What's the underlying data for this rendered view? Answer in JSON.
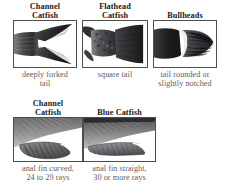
{
  "figure": {
    "background_color": "#ffffff",
    "heading_color": "#18181a",
    "caption_color": "#5d5d5f",
    "panel_border_color": "#4d4d4f"
  },
  "rows": [
    {
      "id": "tail-shape-row",
      "cells": [
        {
          "heading": "Channel\nCatfish",
          "heading_line1": "Channel",
          "heading_line2": "Catfish",
          "caption": "deeply forked tail",
          "caption_line1": "deeply forked",
          "caption_line2": "tail",
          "image_name": "channel-catfish-tail-illustration",
          "image_subject": "deeply forked caudal fin"
        },
        {
          "heading": "Flathead\nCatfish",
          "heading_line1": "Flathead",
          "heading_line2": "Catfish",
          "caption": "square tail",
          "caption_line1": "square tail",
          "caption_line2": "",
          "image_name": "flathead-catfish-tail-illustration",
          "image_subject": "square caudal fin"
        },
        {
          "heading": "Bullheads",
          "heading_line1": "Bullheads",
          "heading_line2": "",
          "caption": "tail rounded or slightly notched",
          "caption_line1": "tail rounded or",
          "caption_line2": "slightly notched",
          "image_name": "bullhead-tail-illustration",
          "image_subject": "rounded caudal fin"
        }
      ]
    },
    {
      "id": "anal-fin-row",
      "cells": [
        {
          "heading": "Channel\nCatfish",
          "heading_line1": "Channel",
          "heading_line2": "Catfish",
          "caption": "anal fin curved, 24 to 29 rays",
          "caption_line1": "anal fin curved,",
          "caption_line2": "24 to 29 rays",
          "image_name": "channel-catfish-anal-fin-illustration",
          "image_subject": "curved anal fin"
        },
        {
          "heading": "Blue Catfish",
          "heading_line1": "Blue Catfish",
          "heading_line2": "",
          "caption": "anal fin straight, 30 or more rays",
          "caption_line1": "anal fin straight,",
          "caption_line2": "30 or more rays",
          "image_name": "blue-catfish-anal-fin-illustration",
          "image_subject": "straight anal fin"
        }
      ]
    }
  ]
}
